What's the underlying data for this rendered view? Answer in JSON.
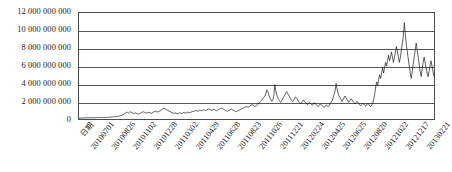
{
  "chart_data": {
    "type": "line",
    "title": "",
    "xlabel": "日期",
    "ylabel": "",
    "grid": true,
    "legend": "none",
    "ylim": [
      0,
      12000000000
    ],
    "y_ticks": [
      "12 000 000 000",
      "10 000 000 000",
      "8 000 000 000",
      "6 000 000 000",
      "4 000 000 000",
      "2 000 000 000",
      "0"
    ],
    "y_tick_values": [
      12000000000,
      10000000000,
      8000000000,
      6000000000,
      4000000000,
      2000000000,
      0
    ],
    "x_tick_labels": [
      "日期",
      "20100701",
      "20100826",
      "20101102",
      "20101228",
      "20110302",
      "20110429",
      "20110628",
      "20110823",
      "20111026",
      "20111221",
      "20120224",
      "20120425",
      "20120625",
      "20120820",
      "20121022",
      "20121217",
      "20130221"
    ],
    "series": [
      {
        "name": "成交额",
        "color": "#1a1a1a",
        "values": [
          120000000,
          95000000,
          140000000,
          110000000,
          105000000,
          130000000,
          150000000,
          125000000,
          118000000,
          160000000,
          140000000,
          135000000,
          128000000,
          155000000,
          145000000,
          138000000,
          150000000,
          142000000,
          165000000,
          158000000,
          170000000,
          162000000,
          155000000,
          175000000,
          168000000,
          180000000,
          172000000,
          165000000,
          190000000,
          182000000,
          195000000,
          205000000,
          198000000,
          215000000,
          225000000,
          240000000,
          255000000,
          235000000,
          270000000,
          290000000,
          310000000,
          340000000,
          380000000,
          420000000,
          470000000,
          520000000,
          610000000,
          700000000,
          780000000,
          720000000,
          680000000,
          760000000,
          820000000,
          760000000,
          700000000,
          660000000,
          620000000,
          680000000,
          640000000,
          600000000,
          560000000,
          600000000,
          660000000,
          700000000,
          760000000,
          820000000,
          780000000,
          720000000,
          660000000,
          700000000,
          760000000,
          720000000,
          680000000,
          640000000,
          700000000,
          760000000,
          820000000,
          880000000,
          840000000,
          780000000,
          820000000,
          880000000,
          940000000,
          1000000000,
          1080000000,
          1160000000,
          1240000000,
          1180000000,
          1100000000,
          1020000000,
          960000000,
          900000000,
          840000000,
          780000000,
          720000000,
          680000000,
          640000000,
          700000000,
          660000000,
          620000000,
          580000000,
          640000000,
          700000000,
          660000000,
          620000000,
          680000000,
          740000000,
          700000000,
          660000000,
          720000000,
          780000000,
          740000000,
          700000000,
          760000000,
          820000000,
          880000000,
          840000000,
          900000000,
          960000000,
          920000000,
          880000000,
          940000000,
          1000000000,
          960000000,
          920000000,
          980000000,
          1040000000,
          1000000000,
          960000000,
          1020000000,
          1080000000,
          1140000000,
          1100000000,
          1040000000,
          980000000,
          1040000000,
          1100000000,
          1060000000,
          1000000000,
          940000000,
          1000000000,
          1060000000,
          1120000000,
          1180000000,
          1240000000,
          1180000000,
          1120000000,
          1060000000,
          1000000000,
          940000000,
          880000000,
          940000000,
          1000000000,
          1060000000,
          1120000000,
          1060000000,
          1000000000,
          940000000,
          880000000,
          820000000,
          880000000,
          940000000,
          1000000000,
          1060000000,
          1120000000,
          1180000000,
          1240000000,
          1300000000,
          1360000000,
          1420000000,
          1380000000,
          1320000000,
          1400000000,
          1480000000,
          1560000000,
          1640000000,
          1580000000,
          1500000000,
          1420000000,
          1500000000,
          1600000000,
          1700000000,
          1820000000,
          1940000000,
          2060000000,
          2180000000,
          2300000000,
          2450000000,
          2600000000,
          2900000000,
          3300000000,
          3100000000,
          2700000000,
          2400000000,
          2200000000,
          2000000000,
          2200000000,
          2600000000,
          3900000000,
          3200000000,
          2700000000,
          2400000000,
          2200000000,
          2000000000,
          1900000000,
          2100000000,
          2300000000,
          2500000000,
          2700000000,
          2900000000,
          3100000000,
          2900000000,
          2700000000,
          2500000000,
          2300000000,
          2100000000,
          1950000000,
          2100000000,
          2300000000,
          2500000000,
          2400000000,
          2200000000,
          2000000000,
          1850000000,
          1700000000,
          1850000000,
          2000000000,
          2150000000,
          2000000000,
          1850000000,
          1700000000,
          1600000000,
          1750000000,
          1900000000,
          1800000000,
          1650000000,
          1550000000,
          1700000000,
          1850000000,
          1750000000,
          1600000000,
          1500000000,
          1400000000,
          1550000000,
          1700000000,
          1600000000,
          1500000000,
          1400000000,
          1300000000,
          1450000000,
          1600000000,
          1500000000,
          1400000000,
          1500000000,
          1700000000,
          1900000000,
          2100000000,
          2400000000,
          2800000000,
          3200000000,
          4000000000,
          3400000000,
          2900000000,
          2600000000,
          2400000000,
          2200000000,
          2000000000,
          2200000000,
          2400000000,
          2600000000,
          2400000000,
          2200000000,
          2000000000,
          1900000000,
          2100000000,
          2300000000,
          2200000000,
          2000000000,
          1850000000,
          1700000000,
          1850000000,
          2000000000,
          1900000000,
          1750000000,
          1600000000,
          1500000000,
          1650000000,
          1800000000,
          1700000000,
          1550000000,
          1450000000,
          1600000000,
          1750000000,
          1650000000,
          1500000000,
          1400000000,
          1550000000,
          1800000000,
          2200000000,
          2800000000,
          3600000000,
          4200000000,
          3800000000,
          4400000000,
          5000000000,
          4600000000,
          5200000000,
          5800000000,
          5200000000,
          5800000000,
          6400000000,
          6000000000,
          6600000000,
          7200000000,
          6600000000,
          7000000000,
          7600000000,
          7000000000,
          6400000000,
          7000000000,
          7600000000,
          8200000000,
          7600000000,
          7000000000,
          6400000000,
          7000000000,
          7800000000,
          8600000000,
          9400000000,
          10900000000,
          9600000000,
          8400000000,
          7600000000,
          6800000000,
          6000000000,
          5200000000,
          4600000000,
          5400000000,
          6200000000,
          7000000000,
          7800000000,
          8600000000,
          7800000000,
          7000000000,
          6200000000,
          5400000000,
          4800000000,
          5600000000,
          6400000000,
          7000000000,
          6400000000,
          5800000000,
          5200000000,
          4800000000,
          5400000000,
          6000000000,
          6600000000,
          6000000000,
          5400000000,
          4800000000
        ]
      }
    ]
  }
}
